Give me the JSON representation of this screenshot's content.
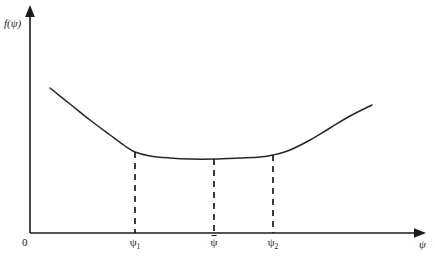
{
  "figure": {
    "axes": {
      "y_label": "f(ψ)",
      "x_label": "ψ",
      "origin_label": "0"
    },
    "tick_labels": [
      {
        "name": "psi-1",
        "text": "ψ",
        "subscript": "1",
        "x": 135,
        "bar": false
      },
      {
        "name": "psi-bar",
        "text": "ψ",
        "subscript": "",
        "x": 214,
        "bar": true
      },
      {
        "name": "psi-2",
        "text": "ψ",
        "subscript": "2",
        "x": 273,
        "bar": false
      }
    ],
    "colors": {
      "curve": "#262626",
      "axis": "#1a1a1a",
      "background": "#ffffff"
    }
  },
  "chart_data": {
    "type": "line",
    "title": "",
    "xlabel": "ψ",
    "ylabel": "f(ψ)",
    "grid": false,
    "legend": null,
    "axis_style": "arrow-ended open axes",
    "origin": {
      "x": 30,
      "y": 233,
      "label": "0"
    },
    "xlim_px": [
      30,
      425
    ],
    "ylim_px": [
      233,
      10
    ],
    "curve_points_px": [
      {
        "x": 50,
        "y": 88
      },
      {
        "x": 70,
        "y": 104
      },
      {
        "x": 90,
        "y": 120
      },
      {
        "x": 110,
        "y": 135
      },
      {
        "x": 125,
        "y": 146
      },
      {
        "x": 135,
        "y": 152
      },
      {
        "x": 150,
        "y": 156
      },
      {
        "x": 170,
        "y": 158
      },
      {
        "x": 190,
        "y": 159
      },
      {
        "x": 214,
        "y": 159
      },
      {
        "x": 240,
        "y": 158
      },
      {
        "x": 260,
        "y": 157
      },
      {
        "x": 273,
        "y": 155
      },
      {
        "x": 290,
        "y": 150
      },
      {
        "x": 310,
        "y": 140
      },
      {
        "x": 330,
        "y": 128
      },
      {
        "x": 350,
        "y": 116
      },
      {
        "x": 372,
        "y": 105
      }
    ],
    "dashed_verticals": [
      {
        "label": "ψ1",
        "x": 135,
        "y_top": 152,
        "y_bottom": 233
      },
      {
        "label": "ψbar",
        "x": 214,
        "y_top": 159,
        "y_bottom": 233
      },
      {
        "label": "ψ2",
        "x": 273,
        "y_top": 155,
        "y_bottom": 233
      }
    ]
  }
}
